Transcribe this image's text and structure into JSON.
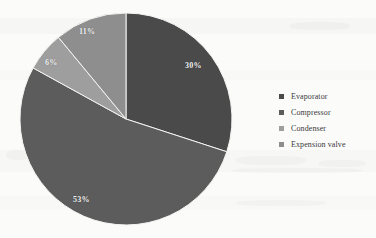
{
  "chart_data": {
    "type": "pie",
    "title": "",
    "labels": [
      "Evaporator",
      "Compressor",
      "Condenser",
      "Expension valve"
    ],
    "values": [
      30,
      53,
      6,
      11
    ],
    "value_labels": [
      "30%",
      "53%",
      "6%",
      "11%"
    ],
    "colors": [
      "#4a4a4a",
      "#5c5c5c",
      "#9e9e9e",
      "#8e8e8e"
    ],
    "legend_position": "right",
    "grid": false,
    "units": "percent",
    "start_angle_deg": 0,
    "direction": "clockwise",
    "slices": [
      {
        "label": "Evaporator",
        "value": 30,
        "value_label": "30%",
        "color": "#4a4a4a"
      },
      {
        "label": "Compressor",
        "value": 53,
        "value_label": "53%",
        "color": "#5c5c5c"
      },
      {
        "label": "Condenser",
        "value": 6,
        "value_label": "6%",
        "color": "#9e9e9e"
      },
      {
        "label": "Expension valve",
        "value": 11,
        "value_label": "11%",
        "color": "#8e8e8e"
      }
    ]
  },
  "legend": {
    "items": [
      {
        "label": "Evaporator",
        "color": "#4a4a4a"
      },
      {
        "label": "Compressor",
        "color": "#5c5c5c"
      },
      {
        "label": "Condenser",
        "color": "#9e9e9e"
      },
      {
        "label": "Expension valve",
        "color": "#8e8e8e"
      }
    ]
  }
}
